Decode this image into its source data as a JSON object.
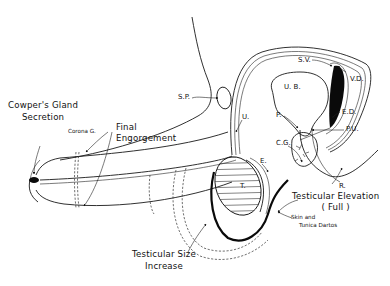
{
  "diagram": {
    "colors": {
      "line": "#1a1a1a",
      "background": "#ffffff",
      "fill_dark": "#0a0a0a"
    },
    "labels": {
      "cowpers_line1": "Cowper's Gland",
      "cowpers_line2": "Secretion",
      "corona": "Corona G.",
      "final_line1": "Final",
      "final_line2": "Engorgement",
      "sp": "S.P.",
      "ub": "U. B.",
      "sv": "S.V.",
      "vd": "V.D.",
      "ed": "E.D.",
      "p": "P.",
      "pu": "P.U.",
      "u": "U.",
      "cg": "C.G.",
      "e": "E.",
      "t": "T.",
      "r": "R.",
      "elevation_line1": "Testicular Elevation",
      "elevation_line2": "( Full )",
      "skin_line1": "Skin and",
      "skin_line2": "Tunica Dartos",
      "size_line1": "Testicular Size",
      "size_line2": "Increase"
    }
  }
}
